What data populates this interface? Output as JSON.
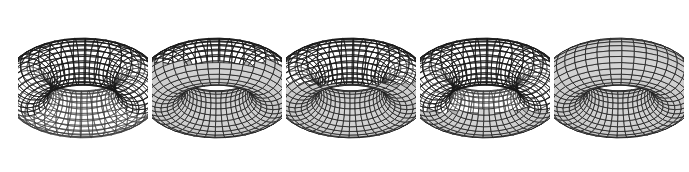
{
  "figure": {
    "width": 689,
    "height": 172,
    "background_color": "#ffffff",
    "caption": ""
  },
  "style": {
    "line_color": "#1a1a1a",
    "hidden_line_color": "#3a3a3a",
    "surface_fill": "#c9c9c9",
    "surface_fill_light": "#d4d4d4",
    "surface_fill_dark": "#b0b0b0",
    "background_color": "#ffffff",
    "line_width": 0.75,
    "hidden_line_width": 0.55
  },
  "geometry": {
    "major_segments": 40,
    "minor_segments": 24,
    "major_radius": 1.0,
    "minor_radius": 0.42,
    "view_rotation_x_deg": 62,
    "view_rotation_z_deg": -38,
    "panel_scale": 56
  },
  "panels": [
    {
      "index": 1,
      "label": "panel-1",
      "x": 18,
      "y": 0,
      "width": 130,
      "height": 172,
      "opacity_label": "fully transparent",
      "hidden_fraction": 0.0,
      "reveal_y": 1.1,
      "show_hidden_lines": true,
      "fill_visible": false
    },
    {
      "index": 2,
      "label": "panel-2",
      "x": 152,
      "y": 0,
      "width": 130,
      "height": 172,
      "opacity_label": "mostly transparent",
      "hidden_fraction": 0.25,
      "reveal_y": 0.44,
      "show_hidden_lines": true,
      "fill_visible": true
    },
    {
      "index": 3,
      "label": "panel-3",
      "x": 286,
      "y": 0,
      "width": 130,
      "height": 172,
      "opacity_label": "half opaque",
      "hidden_fraction": 0.5,
      "reveal_y": 0.06,
      "show_hidden_lines": true,
      "fill_visible": true
    },
    {
      "index": 4,
      "label": "panel-4",
      "x": 420,
      "y": 0,
      "width": 130,
      "height": 172,
      "opacity_label": "mostly opaque",
      "hidden_fraction": 0.8,
      "reveal_y": -0.42,
      "show_hidden_lines": true,
      "fill_visible": true
    },
    {
      "index": 5,
      "label": "panel-5",
      "x": 554,
      "y": 0,
      "width": 130,
      "height": 172,
      "opacity_label": "fully opaque",
      "hidden_fraction": 1.0,
      "reveal_y": -1.4,
      "show_hidden_lines": false,
      "fill_visible": true
    }
  ]
}
